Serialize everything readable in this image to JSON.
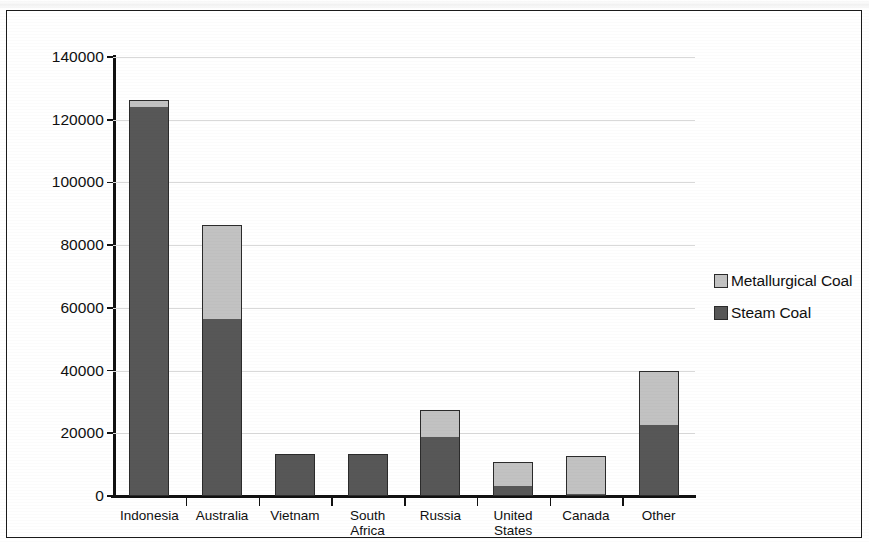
{
  "chart_data": {
    "type": "bar",
    "stacked": true,
    "title": "",
    "xlabel": "",
    "ylabel": "Coal Imports (Thousand Metruc Tons)",
    "categories": [
      "Indonesia",
      "Australia",
      "Vietnam",
      "South Africa",
      "Russia",
      "United\nStates",
      "Canada",
      "Other"
    ],
    "series": [
      {
        "name": "Steam Coal",
        "color": "#575757",
        "values": [
          124000,
          56500,
          13500,
          13400,
          18800,
          3200,
          700,
          22500
        ]
      },
      {
        "name": "Metallurgical Coal",
        "color": "#c2c2c2",
        "values": [
          2200,
          29800,
          0,
          0,
          8600,
          7600,
          12000,
          17400
        ]
      }
    ],
    "totals": [
      126200,
      86300,
      13500,
      13400,
      27400,
      10800,
      12700,
      39900
    ],
    "ylim": [
      0,
      140000
    ],
    "yticks": [
      0,
      20000,
      40000,
      60000,
      80000,
      100000,
      120000,
      140000
    ],
    "ytick_labels": [
      "0",
      "20000",
      "40000",
      "60000",
      "80000",
      "100000",
      "120000",
      "140000"
    ],
    "grid": true,
    "legend_position": "right",
    "legend_order": [
      "Metallurgical Coal",
      "Steam Coal"
    ]
  },
  "legend": {
    "entries": [
      {
        "label": "Metallurgical Coal",
        "color": "#c2c2c2"
      },
      {
        "label": "Steam Coal",
        "color": "#575757"
      }
    ]
  }
}
